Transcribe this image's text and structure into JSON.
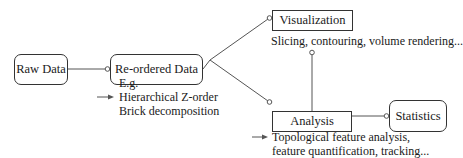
{
  "nodes": {
    "raw_data": {
      "label": "Raw Data",
      "shape": "rounded"
    },
    "reordered_data": {
      "label": "Re-ordered Data",
      "shape": "rounded"
    },
    "visualization": {
      "label": "Visualization",
      "shape": "rect"
    },
    "analysis": {
      "label": "Analysis",
      "shape": "rect"
    },
    "statistics": {
      "label": "Statistics",
      "shape": "rounded"
    }
  },
  "notes": {
    "reordered": {
      "lines": [
        "E.g.",
        "Hierarchical Z-order",
        "Brick decomposition"
      ],
      "arrow_icon": "right-arrow-icon"
    },
    "visualization": {
      "text": "Slicing, contouring, volume rendering..."
    },
    "analysis": {
      "lines": [
        "Topological feature analysis,",
        "feature quantification, tracking..."
      ],
      "arrow_icon": "right-arrow-icon"
    }
  },
  "edges": [
    {
      "from": "raw_data",
      "to": "reordered_data"
    },
    {
      "from": "reordered_data",
      "to": "visualization"
    },
    {
      "from": "reordered_data",
      "to": "analysis"
    },
    {
      "from": "analysis",
      "to": "visualization"
    },
    {
      "from": "analysis",
      "to": "statistics"
    }
  ],
  "colors": {
    "line": "#555555",
    "text": "#1a1a1a"
  }
}
